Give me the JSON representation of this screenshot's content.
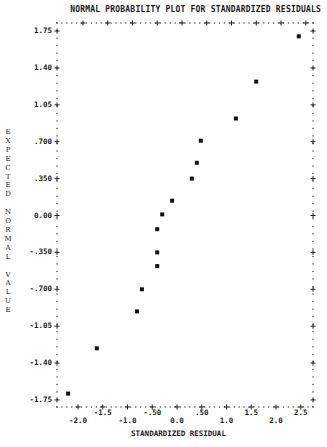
{
  "chart_data": {
    "type": "scatter",
    "title": "NORMAL PROBABILITY PLOT FOR STANDARDIZED RESIDUALS",
    "xlabel": "STANDARDIZED RESIDUAL",
    "ylabel": "EXPECTED NORMAL VALUE",
    "xlim": [
      -2.2,
      2.75
    ],
    "ylim": [
      -1.75,
      1.75
    ],
    "grid": false,
    "x_ticks": [
      "-2.0",
      "-1.5",
      "-1.0",
      "-.50",
      "0.0",
      ".50",
      "1.0",
      "1.5",
      "2.0",
      "2.5"
    ],
    "x_tick_values": [
      -2.0,
      -1.5,
      -1.0,
      -0.5,
      0.0,
      0.5,
      1.0,
      1.5,
      2.0,
      2.5
    ],
    "y_ticks": [
      "1.75",
      "1.40",
      "1.05",
      ".700",
      ".350",
      "0.00",
      "-.350",
      "-.700",
      "-1.05",
      "-1.40",
      "-1.75"
    ],
    "y_tick_values": [
      1.75,
      1.4,
      1.05,
      0.7,
      0.35,
      0.0,
      -0.35,
      -0.7,
      -1.05,
      -1.4,
      -1.75
    ],
    "series": [
      {
        "name": "standardized residuals",
        "marker": "square",
        "points": [
          {
            "x": -2.2,
            "y": -1.69
          },
          {
            "x": -1.62,
            "y": -1.26
          },
          {
            "x": -0.81,
            "y": -0.91
          },
          {
            "x": -0.71,
            "y": -0.7
          },
          {
            "x": -0.4,
            "y": -0.48
          },
          {
            "x": -0.4,
            "y": -0.35
          },
          {
            "x": -0.4,
            "y": -0.13
          },
          {
            "x": -0.3,
            "y": 0.01
          },
          {
            "x": -0.1,
            "y": 0.14
          },
          {
            "x": 0.3,
            "y": 0.35
          },
          {
            "x": 0.4,
            "y": 0.5
          },
          {
            "x": 0.48,
            "y": 0.71
          },
          {
            "x": 1.19,
            "y": 0.92
          },
          {
            "x": 1.6,
            "y": 1.27
          },
          {
            "x": 2.46,
            "y": 1.7
          }
        ]
      }
    ]
  },
  "ylabel_letters": [
    "E",
    "X",
    "P",
    "E",
    "C",
    "T",
    "E",
    "D",
    " ",
    "N",
    "O",
    "R",
    "M",
    "A",
    "L",
    " ",
    "V",
    "A",
    "L",
    "U",
    "E"
  ]
}
